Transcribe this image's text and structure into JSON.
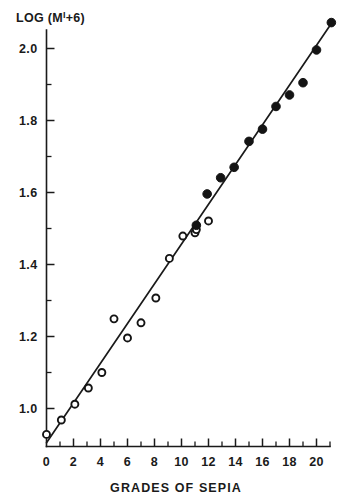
{
  "chart_data": {
    "type": "scatter",
    "title": "",
    "xlabel": "GRADES OF SEPIA",
    "ylabel": "LOG (M'+6)",
    "ylabel_parts": {
      "prefix": "LOG (M",
      "prime": "I",
      "suffix": "+6)"
    },
    "xlim": [
      -0.6,
      21.8
    ],
    "ylim": [
      0.88,
      2.11
    ],
    "grid": false,
    "legend": null,
    "xticks": [
      0,
      2,
      4,
      6,
      8,
      10,
      12,
      14,
      16,
      18,
      20
    ],
    "xtick_labels": [
      "0",
      "2",
      "4",
      "6",
      "8",
      "10",
      "12",
      "14",
      "16",
      "18",
      "20"
    ],
    "xticks_minor": [
      1,
      3,
      5,
      7,
      9,
      11,
      13,
      15,
      17,
      19,
      21
    ],
    "yticks": [
      1.0,
      1.2,
      1.4,
      1.6,
      1.8,
      2.0
    ],
    "ytick_labels": [
      "1.0",
      "1.2",
      "1.4",
      "1.6",
      "1.8",
      "2.0"
    ],
    "yticks_minor": [
      1.1,
      1.3,
      1.5,
      1.7,
      1.9
    ],
    "fit_line": {
      "name": "regression line",
      "x_start": 0.0,
      "y_start": 0.905,
      "x_end": 21.2,
      "y_end": 2.075
    },
    "series": [
      {
        "name": "open circles",
        "marker": "open-circle",
        "points": [
          {
            "x": 0.0,
            "y": 0.928
          },
          {
            "x": 1.1,
            "y": 0.968
          },
          {
            "x": 2.1,
            "y": 1.012
          },
          {
            "x": 3.1,
            "y": 1.057
          },
          {
            "x": 4.1,
            "y": 1.1
          },
          {
            "x": 5.0,
            "y": 1.249
          },
          {
            "x": 6.0,
            "y": 1.196
          },
          {
            "x": 7.0,
            "y": 1.238
          },
          {
            "x": 8.1,
            "y": 1.307
          },
          {
            "x": 9.1,
            "y": 1.417
          },
          {
            "x": 10.1,
            "y": 1.479
          },
          {
            "x": 11.0,
            "y": 1.488
          },
          {
            "x": 12.0,
            "y": 1.521
          },
          {
            "x": 11.1,
            "y": 1.497
          }
        ]
      },
      {
        "name": "filled circles",
        "marker": "filled-circle",
        "points": [
          {
            "x": 11.1,
            "y": 1.509
          },
          {
            "x": 11.9,
            "y": 1.596
          },
          {
            "x": 12.9,
            "y": 1.641
          },
          {
            "x": 13.9,
            "y": 1.67
          },
          {
            "x": 15.0,
            "y": 1.742
          },
          {
            "x": 16.0,
            "y": 1.776
          },
          {
            "x": 17.0,
            "y": 1.839
          },
          {
            "x": 18.0,
            "y": 1.871
          },
          {
            "x": 19.0,
            "y": 1.905
          },
          {
            "x": 20.0,
            "y": 1.996
          },
          {
            "x": 21.1,
            "y": 2.072
          }
        ]
      }
    ]
  },
  "axis_titles": {
    "y": "LOG (M'+6)",
    "x": "GRADES OF SEPIA"
  }
}
